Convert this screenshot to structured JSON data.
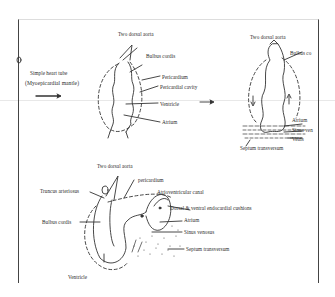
{
  "figure": {
    "panels": [
      {
        "id": "simple-heart-tube",
        "title": "Two dorsal aorta",
        "caption_lines": [
          "Simple heart tube",
          "(Myoepicardial mantle)"
        ],
        "labels": [
          "Bulbus cordis",
          "Pericardium",
          "Pericardial cavity",
          "Ventricle",
          "Atrium"
        ]
      },
      {
        "id": "looping-heart",
        "title": "Two dorsal aorta",
        "labels": [
          "Bulbus co",
          "Atrium",
          "Sinus ven",
          "Veins",
          "Septum transversum"
        ]
      },
      {
        "id": "looped-heart",
        "title": "Two dorsal aorta",
        "labels": [
          "Truncus arteriosus",
          "pericardium",
          "Atrioventricular canal",
          "Dorsal & ventral endocardial cushions",
          "Bulbus cordis",
          "Atrium",
          "Sinus venosus",
          "Septum transversum",
          "Ventricle"
        ]
      }
    ]
  },
  "colors": {
    "ink": "#333333",
    "frame": "#444444",
    "background": "#ffffff"
  }
}
